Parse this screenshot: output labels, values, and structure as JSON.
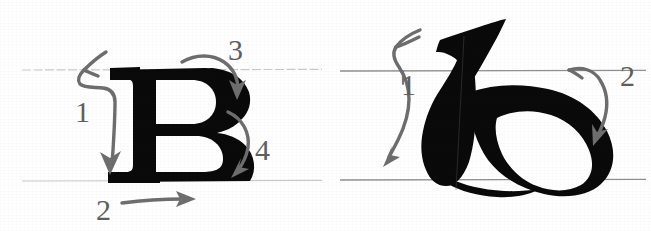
{
  "document": {
    "title": "Letter stroke-order diagram",
    "description": "Two scanned letterform stroke-order illustrations on ruled guide lines with gray hand-drawn direction arrows and numbered strokes.",
    "background_color": "#ffffff",
    "ink_color": "#0a0a0a",
    "arrow_color": "#6e6e6e",
    "numeral_color": "#5f5f5f",
    "guide_color_faint": "#c9c9c9",
    "guide_color_dark": "#8f8f8f"
  },
  "panels": [
    {
      "id": "panel-left",
      "letter": "B",
      "letter_style": "bold serif capital",
      "guides": {
        "cap_line_y": 70,
        "base_line_y": 181,
        "x_start": 22,
        "x_end": 322,
        "style": "faint dotted"
      },
      "strokes": [
        {
          "number": "1",
          "label_x": 75,
          "label_y": 122,
          "direction": "down",
          "description": "entry hook at top-left then vertical stem downward"
        },
        {
          "number": "2",
          "label_x": 96,
          "label_y": 220,
          "direction": "right",
          "description": "horizontal foot serif to the right along the baseline"
        },
        {
          "number": "3",
          "label_x": 228,
          "label_y": 60,
          "direction": "clockwise arc",
          "description": "upper bowl arc over the top, curving down to the waist"
        },
        {
          "number": "4",
          "label_x": 255,
          "label_y": 160,
          "direction": "clockwise arc",
          "description": "lower bowl arc down to the baseline"
        }
      ]
    },
    {
      "id": "panel-right",
      "letter": "b",
      "letter_style": "calligraphic uncial minuscule",
      "guides": {
        "cap_line_y": 71,
        "base_line_y": 180,
        "x_start": 340,
        "x_end": 646,
        "style": "solid gray"
      },
      "strokes": [
        {
          "number": "1",
          "label_x": 401,
          "label_y": 95,
          "direction": "down",
          "description": "flag-shaped ascender then curving stem sweeping down and left"
        },
        {
          "number": "2",
          "label_x": 620,
          "label_y": 86,
          "direction": "down-curve",
          "description": "round bowl arc from the waist curving down around the right side"
        }
      ]
    }
  ]
}
